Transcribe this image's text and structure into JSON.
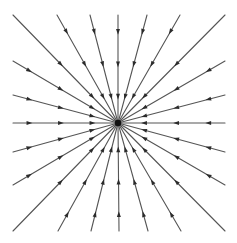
{
  "diagram": {
    "type": "radial-field-lines",
    "direction": "inward",
    "colors": {
      "background": "#ffffff",
      "line": "#555555",
      "arrow": "#2b2b2b",
      "center": "#111111"
    },
    "center": {
      "x": 118,
      "y": 123,
      "radius": 3.2
    },
    "line_width": 1.1,
    "arrow_size": 3.6,
    "endpoints": [
      {
        "x": 13,
        "y": 15,
        "arrows": [
          0.45,
          0.75
        ]
      },
      {
        "x": 57,
        "y": 15,
        "arrows": [
          0.15,
          0.45,
          0.75
        ]
      },
      {
        "x": 90,
        "y": 15,
        "arrows": [
          0.15,
          0.45,
          0.75
        ]
      },
      {
        "x": 118,
        "y": 15,
        "arrows": [
          0.15,
          0.45,
          0.75
        ]
      },
      {
        "x": 147,
        "y": 15,
        "arrows": [
          0.15,
          0.45,
          0.75
        ]
      },
      {
        "x": 180,
        "y": 15,
        "arrows": [
          0.15,
          0.45,
          0.75
        ]
      },
      {
        "x": 225,
        "y": 15,
        "arrows": [
          0.45,
          0.75
        ]
      },
      {
        "x": 225,
        "y": 61,
        "arrows": [
          0.15,
          0.45,
          0.75
        ]
      },
      {
        "x": 225,
        "y": 95,
        "arrows": [
          0.15,
          0.45,
          0.75
        ]
      },
      {
        "x": 225,
        "y": 123,
        "arrows": [
          0.15,
          0.45,
          0.75
        ]
      },
      {
        "x": 225,
        "y": 152,
        "arrows": [
          0.15,
          0.45,
          0.75
        ]
      },
      {
        "x": 225,
        "y": 185,
        "arrows": [
          0.15,
          0.45,
          0.75
        ]
      },
      {
        "x": 225,
        "y": 231,
        "arrows": [
          0.45,
          0.75
        ]
      },
      {
        "x": 181,
        "y": 231,
        "arrows": [
          0.15,
          0.45,
          0.75
        ]
      },
      {
        "x": 148,
        "y": 231,
        "arrows": [
          0.15,
          0.45,
          0.75
        ]
      },
      {
        "x": 119,
        "y": 231,
        "arrows": [
          0.15,
          0.45,
          0.75
        ]
      },
      {
        "x": 91,
        "y": 231,
        "arrows": [
          0.15,
          0.45,
          0.75
        ]
      },
      {
        "x": 58,
        "y": 231,
        "arrows": [
          0.15,
          0.45,
          0.75
        ]
      },
      {
        "x": 13,
        "y": 231,
        "arrows": [
          0.45,
          0.75
        ]
      },
      {
        "x": 13,
        "y": 185,
        "arrows": [
          0.15,
          0.45,
          0.75
        ]
      },
      {
        "x": 13,
        "y": 152,
        "arrows": [
          0.15,
          0.45,
          0.75
        ]
      },
      {
        "x": 13,
        "y": 123,
        "arrows": [
          0.15,
          0.45,
          0.75
        ]
      },
      {
        "x": 13,
        "y": 95,
        "arrows": [
          0.15,
          0.45,
          0.75
        ]
      },
      {
        "x": 13,
        "y": 61,
        "arrows": [
          0.15,
          0.45,
          0.75
        ]
      }
    ]
  }
}
